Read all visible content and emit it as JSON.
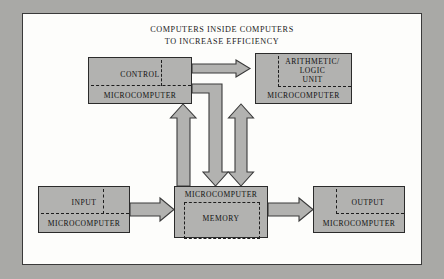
{
  "figure": {
    "title": "COMPUTERS INSIDE COMPUTERS\nTO INCREASE EFFICIENCY",
    "frame_color": "#a9a9a6",
    "page_color": "#fdfdfb",
    "block_fill": "#b2b2b0",
    "line_color": "#2b2b2b"
  },
  "blocks": {
    "control": {
      "primary": "CONTROL",
      "secondary": "MICROCOMPUTER"
    },
    "alu": {
      "primary": "ARITHMETIC/\nLOGIC\nUNIT",
      "secondary": "MICROCOMPUTER"
    },
    "input": {
      "primary": "INPUT",
      "secondary": "MICROCOMPUTER"
    },
    "memory": {
      "primary": "MICROCOMPUTER",
      "secondary": "MEMORY"
    },
    "output": {
      "primary": "OUTPUT",
      "secondary": "MICROCOMPUTER"
    }
  },
  "connections": [
    {
      "name": "control-to-alu",
      "from": "control",
      "to": "alu",
      "direction": "right"
    },
    {
      "name": "control-to-memory",
      "from": "control",
      "to": "memory",
      "direction": "down"
    },
    {
      "name": "memory-to-control",
      "from": "memory",
      "to": "control",
      "direction": "up"
    },
    {
      "name": "alu-memory-bidirectional",
      "from": "alu",
      "to": "memory",
      "direction": "both"
    },
    {
      "name": "input-to-memory",
      "from": "input",
      "to": "memory",
      "direction": "right"
    },
    {
      "name": "memory-to-output",
      "from": "memory",
      "to": "output",
      "direction": "right"
    }
  ]
}
